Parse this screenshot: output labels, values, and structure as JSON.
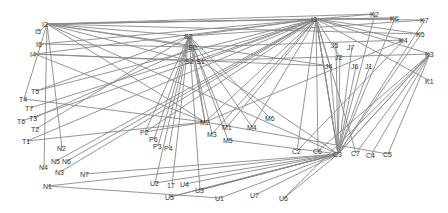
{
  "diagram": {
    "type": "network-graph",
    "colors": {
      "edge": "#8a8a8a",
      "label": "#333333",
      "background": "#ffffff"
    },
    "nodes": [
      {
        "id": "I2",
        "label": "I2",
        "x": 47,
        "y": 24
      },
      {
        "id": "I5",
        "label": "I5",
        "x": 40,
        "y": 31
      },
      {
        "id": "I6",
        "label": "I6",
        "x": 41,
        "y": 44
      },
      {
        "id": "I4",
        "label": "I4",
        "x": 35,
        "y": 54
      },
      {
        "id": "T5",
        "label": "T5",
        "x": 36,
        "y": 91
      },
      {
        "id": "T4",
        "label": "T4",
        "x": 24,
        "y": 99
      },
      {
        "id": "T7",
        "label": "T7",
        "x": 30,
        "y": 108
      },
      {
        "id": "T3",
        "label": "T3",
        "x": 34,
        "y": 118
      },
      {
        "id": "T6",
        "label": "T6",
        "x": 22,
        "y": 121
      },
      {
        "id": "T2",
        "label": "T2",
        "x": 36,
        "y": 129
      },
      {
        "id": "T1",
        "label": "T1",
        "x": 27,
        "y": 141
      },
      {
        "id": "N2",
        "label": "N2",
        "x": 62,
        "y": 148
      },
      {
        "id": "N5",
        "label": "N5",
        "x": 56,
        "y": 161
      },
      {
        "id": "N6",
        "label": "N6",
        "x": 67,
        "y": 161
      },
      {
        "id": "N4",
        "label": "N4",
        "x": 44,
        "y": 167
      },
      {
        "id": "N3",
        "label": "N3",
        "x": 60,
        "y": 172
      },
      {
        "id": "N7",
        "label": "N7",
        "x": 85,
        "y": 174
      },
      {
        "id": "N1",
        "label": "N1",
        "x": 48,
        "y": 186
      },
      {
        "id": "S3",
        "label": "S3",
        "x": 189,
        "y": 36
      },
      {
        "id": "S0",
        "label": "S0",
        "x": 193,
        "y": 47
      },
      {
        "id": "S2",
        "label": "S2",
        "x": 190,
        "y": 61
      },
      {
        "id": "S1",
        "label": "S1",
        "x": 201,
        "y": 61
      },
      {
        "id": "P2",
        "label": "P2",
        "x": 145,
        "y": 132
      },
      {
        "id": "P6",
        "label": "P6",
        "x": 154,
        "y": 139
      },
      {
        "id": "P3",
        "label": "P3",
        "x": 158,
        "y": 146
      },
      {
        "id": "P4",
        "label": "P4",
        "x": 169,
        "y": 148
      },
      {
        "id": "M2",
        "label": "M2",
        "x": 205,
        "y": 122
      },
      {
        "id": "M1",
        "label": "M1",
        "x": 227,
        "y": 127
      },
      {
        "id": "M3",
        "label": "M3",
        "x": 212,
        "y": 134
      },
      {
        "id": "M5",
        "label": "M5",
        "x": 228,
        "y": 140
      },
      {
        "id": "M4",
        "label": "M4",
        "x": 252,
        "y": 127
      },
      {
        "id": "M6",
        "label": "M6",
        "x": 270,
        "y": 118
      },
      {
        "id": "I3",
        "label": "I3",
        "x": 316,
        "y": 19
      },
      {
        "id": "K2",
        "label": "K2",
        "x": 375,
        "y": 14
      },
      {
        "id": "K6",
        "label": "K6",
        "x": 395,
        "y": 18
      },
      {
        "id": "K7",
        "label": "K7",
        "x": 425,
        "y": 20
      },
      {
        "id": "K5",
        "label": "K5",
        "x": 421,
        "y": 34
      },
      {
        "id": "K4",
        "label": "K4",
        "x": 404,
        "y": 40
      },
      {
        "id": "K3",
        "label": "K3",
        "x": 430,
        "y": 54
      },
      {
        "id": "K1",
        "label": "K1",
        "x": 430,
        "y": 81
      },
      {
        "id": "J5",
        "label": "J5",
        "x": 336,
        "y": 45
      },
      {
        "id": "J7",
        "label": "J7",
        "x": 352,
        "y": 47
      },
      {
        "id": "J2",
        "label": "J2",
        "x": 340,
        "y": 57
      },
      {
        "id": "J4",
        "label": "J4",
        "x": 330,
        "y": 66
      },
      {
        "id": "J6",
        "label": "J6",
        "x": 356,
        "y": 66
      },
      {
        "id": "J1",
        "label": "J1",
        "x": 370,
        "y": 66
      },
      {
        "id": "C2",
        "label": "C2",
        "x": 297,
        "y": 151
      },
      {
        "id": "C6",
        "label": "C6",
        "x": 318,
        "y": 151
      },
      {
        "id": "C3",
        "label": "C3",
        "x": 338,
        "y": 154
      },
      {
        "id": "C7",
        "label": "C7",
        "x": 356,
        "y": 153
      },
      {
        "id": "C4",
        "label": "C4",
        "x": 371,
        "y": 155
      },
      {
        "id": "C5",
        "label": "C5",
        "x": 388,
        "y": 154
      },
      {
        "id": "U2",
        "label": "U2",
        "x": 155,
        "y": 183
      },
      {
        "id": "I7",
        "label": "17",
        "x": 172,
        "y": 185
      },
      {
        "id": "U4",
        "label": "U4",
        "x": 185,
        "y": 184
      },
      {
        "id": "U3",
        "label": "U3",
        "x": 200,
        "y": 190
      },
      {
        "id": "U5",
        "label": "U5",
        "x": 170,
        "y": 197
      },
      {
        "id": "U1",
        "label": "U1",
        "x": 220,
        "y": 198
      },
      {
        "id": "U7",
        "label": "U7",
        "x": 255,
        "y": 195
      },
      {
        "id": "U6",
        "label": "U6",
        "x": 284,
        "y": 198
      }
    ],
    "edges": [
      [
        "I2",
        "I3"
      ],
      [
        "I2",
        "I3"
      ],
      [
        "I2",
        "K2"
      ],
      [
        "I2",
        "K6"
      ],
      [
        "I2",
        "K5"
      ],
      [
        "I2",
        "S3"
      ],
      [
        "I2",
        "S0"
      ],
      [
        "I2",
        "S2"
      ],
      [
        "I2",
        "J4"
      ],
      [
        "I2",
        "M2"
      ],
      [
        "I2",
        "N2"
      ],
      [
        "I2",
        "N4"
      ],
      [
        "I2",
        "T4"
      ],
      [
        "I2",
        "C3"
      ],
      [
        "I2",
        "I5"
      ],
      [
        "I6",
        "I3"
      ],
      [
        "I6",
        "S0"
      ],
      [
        "I4",
        "S2"
      ],
      [
        "I4",
        "I3"
      ],
      [
        "I4",
        "M2"
      ],
      [
        "I4",
        "J4"
      ],
      [
        "T5",
        "I3"
      ],
      [
        "T5",
        "S3"
      ],
      [
        "T4",
        "M2"
      ],
      [
        "T7",
        "I3"
      ],
      [
        "T3",
        "S0"
      ],
      [
        "T6",
        "I3"
      ],
      [
        "T2",
        "S3"
      ],
      [
        "T1",
        "I3"
      ],
      [
        "N5",
        "I3"
      ],
      [
        "N6",
        "I3"
      ],
      [
        "N3",
        "I3"
      ],
      [
        "N7",
        "C3"
      ],
      [
        "N1",
        "U1"
      ],
      [
        "N1",
        "C3"
      ],
      [
        "S3",
        "I3"
      ],
      [
        "S3",
        "K7"
      ],
      [
        "S3",
        "P2"
      ],
      [
        "S3",
        "P6"
      ],
      [
        "S3",
        "P3"
      ],
      [
        "S3",
        "P4"
      ],
      [
        "S3",
        "M2"
      ],
      [
        "S3",
        "M1"
      ],
      [
        "S3",
        "M3"
      ],
      [
        "S3",
        "M4"
      ],
      [
        "S3",
        "M6"
      ],
      [
        "S3",
        "M5"
      ],
      [
        "S3",
        "U2"
      ],
      [
        "S3",
        "I7"
      ],
      [
        "S3",
        "U3"
      ],
      [
        "S0",
        "K4"
      ],
      [
        "S0",
        "M2"
      ],
      [
        "S1",
        "I3"
      ],
      [
        "S1",
        "C3"
      ],
      [
        "S2",
        "K3"
      ],
      [
        "I3",
        "K2"
      ],
      [
        "I3",
        "K6"
      ],
      [
        "I3",
        "K7"
      ],
      [
        "I3",
        "K5"
      ],
      [
        "I3",
        "K4"
      ],
      [
        "I3",
        "K3"
      ],
      [
        "I3",
        "K1"
      ],
      [
        "I3",
        "M2"
      ],
      [
        "I3",
        "M1"
      ],
      [
        "I3",
        "M4"
      ],
      [
        "I3",
        "M3"
      ],
      [
        "I3",
        "P2"
      ],
      [
        "I3",
        "C3"
      ],
      [
        "I3",
        "C3"
      ],
      [
        "I3",
        "C3"
      ],
      [
        "I3",
        "C7"
      ],
      [
        "I3",
        "C2"
      ],
      [
        "I3",
        "C6"
      ],
      [
        "I3",
        "J4"
      ],
      [
        "I3",
        "J2"
      ],
      [
        "J4",
        "C3"
      ],
      [
        "J5",
        "C3"
      ],
      [
        "J2",
        "C3"
      ],
      [
        "J7",
        "C3"
      ],
      [
        "J6",
        "C3"
      ],
      [
        "J1",
        "C3"
      ],
      [
        "K2",
        "C3"
      ],
      [
        "K6",
        "C3"
      ],
      [
        "K7",
        "C3"
      ],
      [
        "K5",
        "C3"
      ],
      [
        "K4",
        "C2"
      ],
      [
        "K4",
        "M2"
      ],
      [
        "K3",
        "C3"
      ],
      [
        "K3",
        "C3"
      ],
      [
        "K3",
        "C7"
      ],
      [
        "K3",
        "C4"
      ],
      [
        "K3",
        "C5"
      ],
      [
        "K3",
        "C6"
      ],
      [
        "K3",
        "U6"
      ],
      [
        "C3",
        "U2"
      ],
      [
        "C3",
        "U4"
      ],
      [
        "C3",
        "U3"
      ],
      [
        "C3",
        "U3"
      ],
      [
        "C3",
        "U5"
      ],
      [
        "C3",
        "U5"
      ],
      [
        "C3",
        "U1"
      ],
      [
        "C3",
        "U7"
      ],
      [
        "C3",
        "U6"
      ],
      [
        "M2",
        "C5"
      ],
      [
        "M5",
        "C3"
      ],
      [
        "P2",
        "M2"
      ],
      [
        "T1",
        "M2"
      ]
    ]
  }
}
